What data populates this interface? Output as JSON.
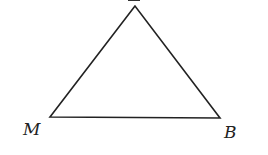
{
  "diagram": {
    "type": "triangle",
    "vertices": [
      {
        "label": "",
        "partial_label": true,
        "x": 135,
        "y": 6
      },
      {
        "label": "M",
        "x": 50,
        "y": 117
      },
      {
        "label": "B",
        "x": 220,
        "y": 118
      }
    ],
    "labels": {
      "top": "",
      "left": "M",
      "right": "B"
    },
    "stroke_color": "#222222"
  }
}
